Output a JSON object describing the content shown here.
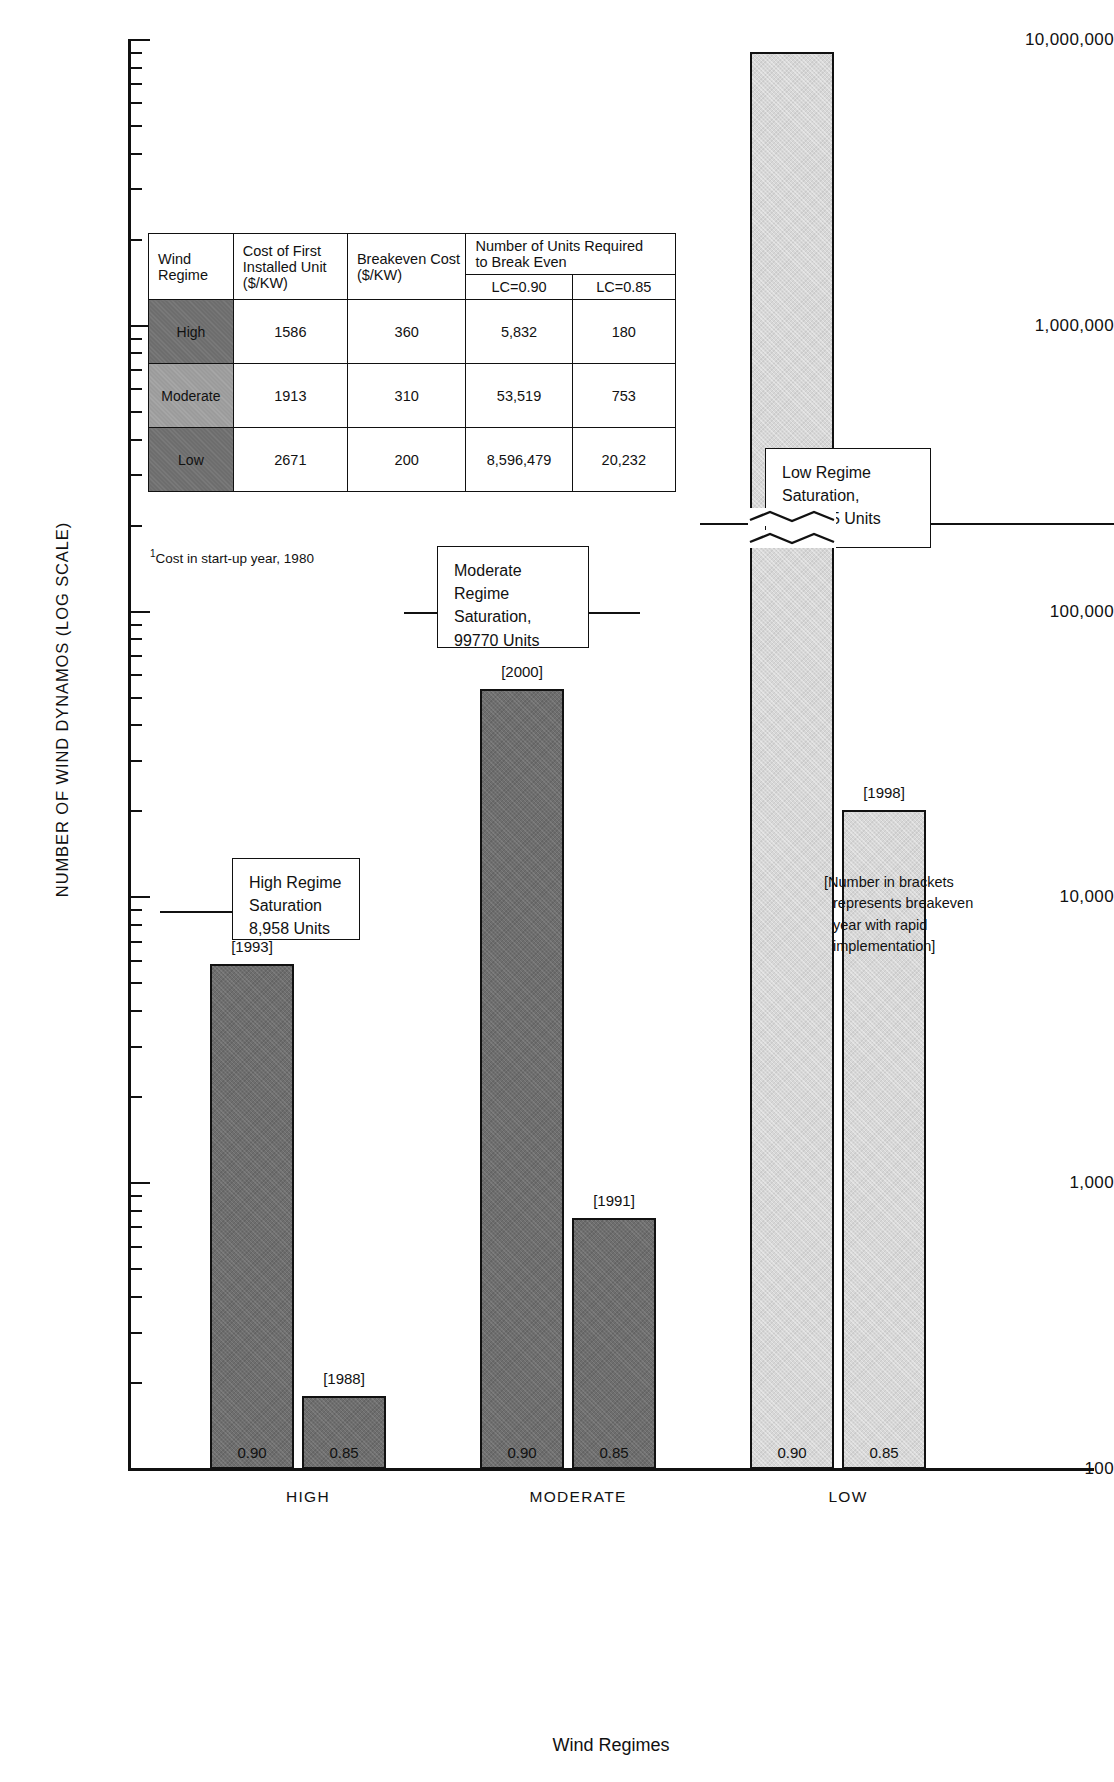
{
  "chart_data": {
    "type": "bar",
    "title": "",
    "xlabel": "Wind Regimes",
    "ylabel": "NUMBER OF WIND DYNAMOS (LOG SCALE)",
    "scale": "log",
    "ylim": [
      100,
      10000000
    ],
    "grid": false,
    "ytick_labels": [
      "10,000,000",
      "1,000,000",
      "100,000",
      "10,000",
      "1,000",
      "100"
    ],
    "ytick_values": [
      10000000,
      1000000,
      100000,
      10000,
      1000,
      100
    ],
    "categories": [
      "HIGH",
      "MODERATE",
      "LOW"
    ],
    "series": [
      {
        "name": "0.90",
        "values": [
          5832,
          53519,
          8596479
        ]
      },
      {
        "name": "0.85",
        "values": [
          180,
          753,
          20232
        ]
      }
    ],
    "bar_labels": {
      "0.90": [
        "[1993]",
        "[2000]",
        ""
      ],
      "0.85": [
        "[1988]",
        "[1991]",
        "[1998]"
      ]
    },
    "bar_value_labels": [
      "0.90",
      "0.85"
    ],
    "truncated_bars": [
      "LOW 0.90"
    ],
    "annotations": [
      "High Regime Saturation 8,958 Units",
      "Moderate Regime Saturation, 99770 Units",
      "Low Regime Saturation, 204,775 Units",
      "[Number in brackets represents breakeven year with rapid implementation]"
    ]
  },
  "axis": {
    "y_label": "NUMBER OF WIND DYNAMOS (LOG SCALE)",
    "x_label": "Wind Regimes",
    "y_ticks": [
      "10,000,000",
      "1,000,000",
      "100,000",
      "10,000",
      "1,000",
      "100"
    ],
    "x_categories": [
      "HIGH",
      "MODERATE",
      "LOW"
    ]
  },
  "bars": {
    "high_090": {
      "value": "5,832",
      "label": "0.90",
      "year": "[1993]"
    },
    "high_085": {
      "value": "180",
      "label": "0.85",
      "year": "[1988]"
    },
    "moderate_090": {
      "value": "53,519",
      "label": "0.90",
      "year": "[2000]"
    },
    "moderate_085": {
      "value": "753",
      "label": "0.85",
      "year": "[1991]"
    },
    "low_090": {
      "value": "8,596,479",
      "label": "0.90",
      "year": ""
    },
    "low_085": {
      "value": "20,232",
      "label": "0.85",
      "year": "[1998]"
    }
  },
  "callouts": {
    "high": {
      "line1": "High Regime",
      "line2": "Saturation",
      "line3": "8,958 Units",
      "value": 8958
    },
    "moderate": {
      "line1": "Moderate Regime",
      "line2": "Saturation,",
      "line3": "99770 Units",
      "value": 99770
    },
    "low": {
      "line1": "Low Regime",
      "line2": "Saturation,",
      "line3": "204,775 Units",
      "value": 204775
    }
  },
  "bracket_note": {
    "line1": "[Number in brackets",
    "line2": "represents breakeven",
    "line3": "year with rapid",
    "line4": "implementation]"
  },
  "table": {
    "headers": {
      "regime": "Wind Regime",
      "regime_l1": "Wind",
      "regime_l2": "Regime",
      "cost_first": "Cost of First Installed Unit ($/KW)",
      "cost_first_l1": "Cost of First",
      "cost_first_l2": "Installed Unit",
      "cost_first_l3": "($/KW)",
      "breakeven": "Breakeven Cost ($/KW)",
      "breakeven_l1": "Breakeven Cost",
      "breakeven_l2": "($/KW)",
      "units_group": "Number of Units Required to Break Even",
      "units_group_l1": "Number of Units Required",
      "units_group_l2": "to Break Even",
      "lc090": "LC=0.90",
      "lc085": "LC=0.85"
    },
    "rows": [
      {
        "regime": "High",
        "cost_first": "1586",
        "breakeven": "360",
        "lc090": "5,832",
        "lc085": "180"
      },
      {
        "regime": "Moderate",
        "cost_first": "1913",
        "breakeven": "310",
        "lc090": "53,519",
        "lc085": "753"
      },
      {
        "regime": "Low",
        "cost_first": "2671",
        "breakeven": "200",
        "lc090": "8,596,479",
        "lc085": "20,232"
      }
    ],
    "footnote_marker": "1",
    "footnote": "Cost in start-up year, 1980"
  },
  "colors": {
    "dark_bar": "#6e6e6e",
    "light_bar": "#d7d7d7",
    "axis": "#111111",
    "background": "#ffffff"
  }
}
